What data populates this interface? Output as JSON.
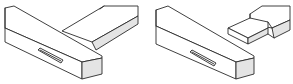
{
  "figure": {
    "panels": [
      {
        "id": "assembled",
        "label": "",
        "parts": [
          "mortise-member",
          "tenon-member"
        ]
      },
      {
        "id": "exploded",
        "label": "",
        "parts": [
          "mortise-member",
          "tenon-member"
        ]
      }
    ]
  },
  "colors": {
    "line": "#2a2a2a",
    "shade": "#e4e4e4",
    "background": "#ffffff"
  }
}
